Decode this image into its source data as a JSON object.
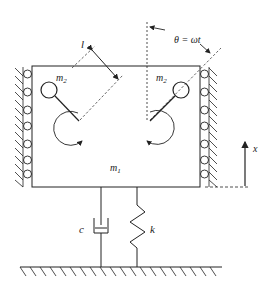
{
  "diagram": {
    "labels": {
      "length": "l",
      "angle": "θ = ωt",
      "rotor_mass_left": "m",
      "rotor_mass_left_sub": "2",
      "rotor_mass_right": "m",
      "rotor_mass_right_sub": "2",
      "main_mass": "m",
      "main_mass_sub": "1",
      "damper": "c",
      "spring": "k",
      "displacement": "x"
    },
    "colors": {
      "line": "#222222",
      "background": "#ffffff"
    }
  }
}
